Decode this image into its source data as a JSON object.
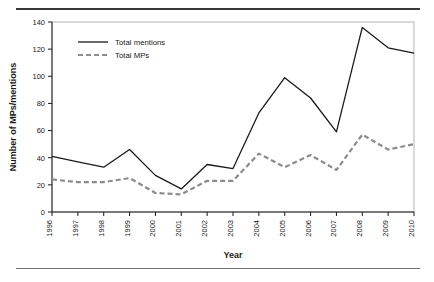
{
  "chart_data": {
    "type": "line",
    "title": "",
    "xlabel": "Year",
    "ylabel": "Number of MPs/mentions",
    "categories": [
      "1996",
      "1997",
      "1998",
      "1999",
      "2000",
      "2001",
      "2002",
      "2003",
      "2004",
      "2005",
      "2006",
      "2007",
      "2008",
      "2009",
      "2010"
    ],
    "x": [
      1996,
      1997,
      1998,
      1999,
      2000,
      2001,
      2002,
      2003,
      2004,
      2005,
      2006,
      2007,
      2008,
      2009,
      2010
    ],
    "series": [
      {
        "name": "Total mentions",
        "style": "solid",
        "color": "#1a1a1a",
        "values": [
          41,
          37,
          33,
          46,
          27,
          17,
          35,
          32,
          73,
          99,
          84,
          59,
          136,
          121,
          117
        ]
      },
      {
        "name": "Total MPs",
        "style": "dashed",
        "color": "#8c8c8c",
        "values": [
          24,
          22,
          22,
          25,
          14,
          13,
          23,
          23,
          43,
          33,
          42,
          31,
          57,
          46,
          50
        ]
      }
    ],
    "ylim": [
      0,
      140
    ],
    "yticks": [
      0,
      20,
      40,
      60,
      80,
      100,
      120,
      140
    ],
    "ytick_labels": [
      "0",
      "20",
      "40",
      "60",
      "80",
      "100",
      "120",
      "140"
    ],
    "xlim": [
      1996,
      2010
    ],
    "grid": false,
    "legend_position": "top-left-inside",
    "legend": [
      {
        "label": "Total mentions",
        "style": "solid",
        "color": "#1a1a1a"
      },
      {
        "label": "Total MPs",
        "style": "dashed",
        "color": "#8c8c8c"
      }
    ]
  },
  "figure": {
    "rule_top_color": "#3a3a3a",
    "rule_bottom_color": "#6f6f6f",
    "plot_border_color": "#b4b4b4",
    "background": "#ffffff"
  }
}
